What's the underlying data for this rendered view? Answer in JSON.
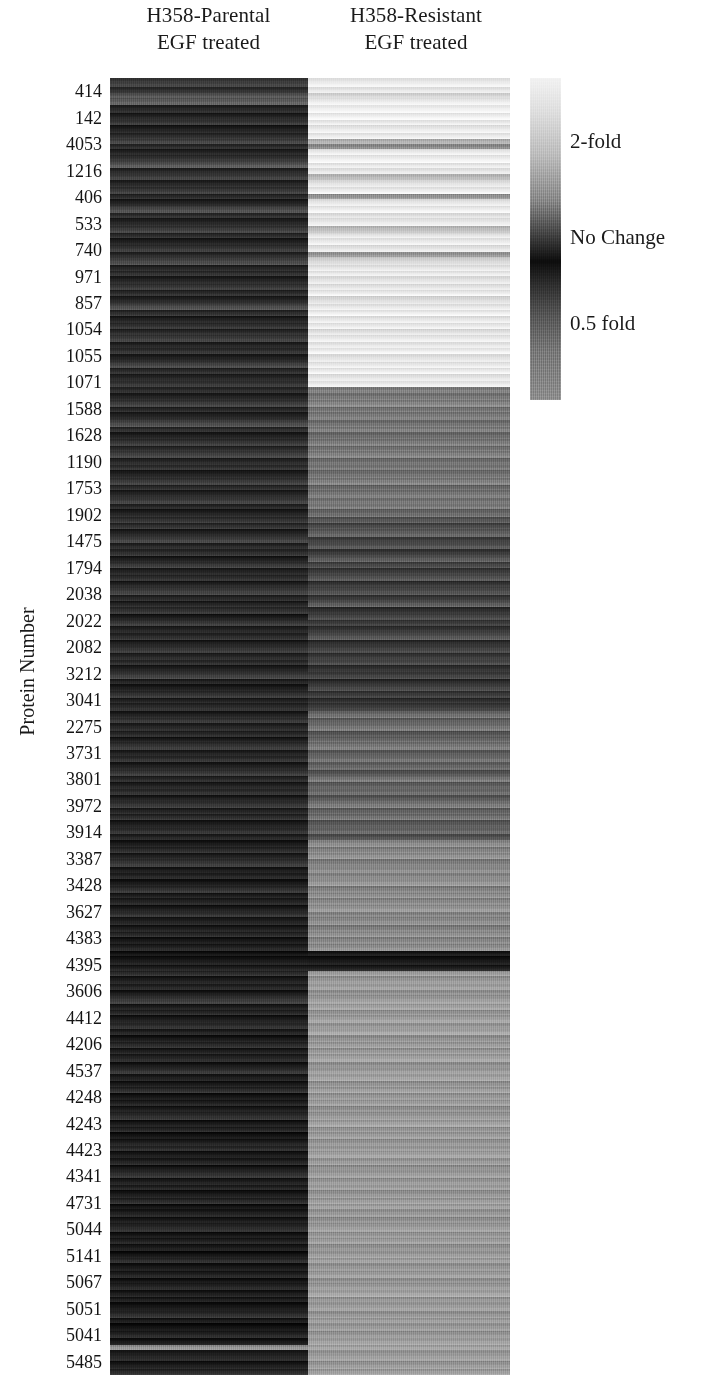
{
  "figure": {
    "type": "heatmap",
    "background": "#ffffff",
    "y_axis_title": "Protein Number"
  },
  "columns": [
    {
      "id": "parental",
      "line1": "H358-Parental",
      "line2": "EGF treated"
    },
    {
      "id": "resistant",
      "line1": "H358-Resistant",
      "line2": "EGF treated"
    }
  ],
  "legend": {
    "title": "",
    "high_label": "2-fold",
    "mid_label": "No Change",
    "low_label": "0.5 fold",
    "high_color": "#f2f2f2",
    "mid_color": "#0d0d0d",
    "low_color": "#8f8f8f"
  },
  "row_labels": [
    "414",
    "142",
    "4053",
    "1216",
    "406",
    "533",
    "740",
    "971",
    "857",
    "1054",
    "1055",
    "1071",
    "1588",
    "1628",
    "1190",
    "1753",
    "1902",
    "1475",
    "1794",
    "2038",
    "2022",
    "2082",
    "3212",
    "3041",
    "2275",
    "3731",
    "3801",
    "3972",
    "3914",
    "3387",
    "3428",
    "3627",
    "4383",
    "4395",
    "3606",
    "4412",
    "4206",
    "4537",
    "4248",
    "4243",
    "4423",
    "4341",
    "4731",
    "5044",
    "5141",
    "5067",
    "5051",
    "5041",
    "5485"
  ],
  "chart_data": {
    "type": "heatmap",
    "title": "",
    "xlabel": "",
    "ylabel": "Protein Number",
    "colormap": "grayscale",
    "colorbar": {
      "ticks": [
        {
          "value": 2.0,
          "label": "2-fold",
          "position": 0.2
        },
        {
          "value": 1.0,
          "label": "No Change",
          "position": 0.5
        },
        {
          "value": 0.5,
          "label": "0.5 fold",
          "position": 0.77
        }
      ],
      "vmin_label": "0.5 fold",
      "vmax_label": "2-fold",
      "orientation": "vertical"
    },
    "categories": [
      "H358-Parental EGF treated",
      "H358-Resistant EGF treated"
    ],
    "y_tick_labels": [
      "414",
      "142",
      "4053",
      "1216",
      "406",
      "533",
      "740",
      "971",
      "857",
      "1054",
      "1055",
      "1071",
      "1588",
      "1628",
      "1190",
      "1753",
      "1902",
      "1475",
      "1794",
      "2038",
      "2022",
      "2082",
      "3212",
      "3041",
      "2275",
      "3731",
      "3801",
      "3972",
      "3914",
      "3387",
      "3428",
      "3627",
      "4383",
      "4395",
      "3606",
      "4412",
      "4206",
      "4537",
      "4248",
      "4243",
      "4423",
      "4341",
      "4731",
      "5044",
      "5141",
      "5067",
      "5051",
      "5041",
      "5485"
    ],
    "note": "Rows are ordered protein bands; values are grayscale intensity 0-255 sampled per band for each of the two columns. Light = up to 2-fold, black = no change, mid-gray = 0.5 fold.",
    "bands": [
      {
        "h": 10,
        "parental": 62,
        "resistant": 236
      },
      {
        "h": 7,
        "parental": 48,
        "resistant": 232
      },
      {
        "h": 5,
        "parental": 86,
        "resistant": 214
      },
      {
        "h": 8,
        "parental": 96,
        "resistant": 238
      },
      {
        "h": 9,
        "parental": 40,
        "resistant": 242
      },
      {
        "h": 7,
        "parental": 34,
        "resistant": 240
      },
      {
        "h": 6,
        "parental": 58,
        "resistant": 236
      },
      {
        "h": 8,
        "parental": 30,
        "resistant": 233
      },
      {
        "h": 7,
        "parental": 46,
        "resistant": 237
      },
      {
        "h": 6,
        "parental": 70,
        "resistant": 180
      },
      {
        "h": 5,
        "parental": 44,
        "resistant": 140
      },
      {
        "h": 7,
        "parental": 36,
        "resistant": 236
      },
      {
        "h": 8,
        "parental": 52,
        "resistant": 238
      },
      {
        "h": 6,
        "parental": 92,
        "resistant": 235
      },
      {
        "h": 7,
        "parental": 40,
        "resistant": 231
      },
      {
        "h": 6,
        "parental": 64,
        "resistant": 186
      },
      {
        "h": 8,
        "parental": 38,
        "resistant": 228
      },
      {
        "h": 7,
        "parental": 56,
        "resistant": 236
      },
      {
        "h": 6,
        "parental": 42,
        "resistant": 150
      },
      {
        "h": 8,
        "parental": 34,
        "resistant": 232
      },
      {
        "h": 7,
        "parental": 74,
        "resistant": 238
      },
      {
        "h": 6,
        "parental": 46,
        "resistant": 225
      },
      {
        "h": 9,
        "parental": 36,
        "resistant": 234
      },
      {
        "h": 7,
        "parental": 60,
        "resistant": 190
      },
      {
        "h": 6,
        "parental": 44,
        "resistant": 232
      },
      {
        "h": 8,
        "parental": 32,
        "resistant": 236
      },
      {
        "h": 7,
        "parental": 54,
        "resistant": 228
      },
      {
        "h": 6,
        "parental": 40,
        "resistant": 152
      },
      {
        "h": 8,
        "parental": 68,
        "resistant": 214
      },
      {
        "h": 7,
        "parental": 38,
        "resistant": 232
      },
      {
        "h": 6,
        "parental": 50,
        "resistant": 236
      },
      {
        "h": 8,
        "parental": 34,
        "resistant": 226
      },
      {
        "h": 7,
        "parental": 58,
        "resistant": 230
      },
      {
        "h": 6,
        "parental": 42,
        "resistant": 236
      },
      {
        "h": 9,
        "parental": 36,
        "resistant": 220
      },
      {
        "h": 7,
        "parental": 78,
        "resistant": 234
      },
      {
        "h": 6,
        "parental": 44,
        "resistant": 238
      },
      {
        "h": 8,
        "parental": 32,
        "resistant": 230
      },
      {
        "h": 7,
        "parental": 52,
        "resistant": 236
      },
      {
        "h": 6,
        "parental": 40,
        "resistant": 224
      },
      {
        "h": 8,
        "parental": 62,
        "resistant": 236
      },
      {
        "h": 7,
        "parental": 36,
        "resistant": 232
      },
      {
        "h": 6,
        "parental": 48,
        "resistant": 238
      },
      {
        "h": 9,
        "parental": 34,
        "resistant": 228
      },
      {
        "h": 7,
        "parental": 70,
        "resistant": 235
      },
      {
        "h": 6,
        "parental": 42,
        "resistant": 236
      },
      {
        "h": 8,
        "parental": 38,
        "resistant": 230
      },
      {
        "h": 7,
        "parental": 56,
        "resistant": 237
      },
      {
        "h": 6,
        "parental": 44,
        "resistant": 128
      },
      {
        "h": 8,
        "parental": 34,
        "resistant": 120
      },
      {
        "h": 7,
        "parental": 60,
        "resistant": 134
      },
      {
        "h": 6,
        "parental": 40,
        "resistant": 118
      },
      {
        "h": 9,
        "parental": 36,
        "resistant": 126
      },
      {
        "h": 7,
        "parental": 72,
        "resistant": 112
      },
      {
        "h": 6,
        "parental": 46,
        "resistant": 130
      },
      {
        "h": 8,
        "parental": 32,
        "resistant": 108
      },
      {
        "h": 7,
        "parental": 54,
        "resistant": 124
      },
      {
        "h": 6,
        "parental": 42,
        "resistant": 116
      },
      {
        "h": 8,
        "parental": 66,
        "resistant": 132
      },
      {
        "h": 7,
        "parental": 38,
        "resistant": 110
      },
      {
        "h": 6,
        "parental": 50,
        "resistant": 122
      },
      {
        "h": 9,
        "parental": 34,
        "resistant": 114
      },
      {
        "h": 7,
        "parental": 58,
        "resistant": 128
      },
      {
        "h": 6,
        "parental": 44,
        "resistant": 106
      },
      {
        "h": 8,
        "parental": 36,
        "resistant": 120
      },
      {
        "h": 7,
        "parental": 64,
        "resistant": 118
      },
      {
        "h": 6,
        "parental": 40,
        "resistant": 126
      },
      {
        "h": 8,
        "parental": 32,
        "resistant": 104
      },
      {
        "h": 7,
        "parental": 52,
        "resistant": 88
      },
      {
        "h": 6,
        "parental": 46,
        "resistant": 72
      },
      {
        "h": 9,
        "parental": 34,
        "resistant": 96
      },
      {
        "h": 7,
        "parental": 68,
        "resistant": 64
      },
      {
        "h": 6,
        "parental": 38,
        "resistant": 84
      },
      {
        "h": 8,
        "parental": 44,
        "resistant": 56
      },
      {
        "h": 7,
        "parental": 30,
        "resistant": 92
      },
      {
        "h": 6,
        "parental": 56,
        "resistant": 70
      },
      {
        "h": 8,
        "parental": 36,
        "resistant": 60
      },
      {
        "h": 7,
        "parental": 48,
        "resistant": 86
      },
      {
        "h": 6,
        "parental": 32,
        "resistant": 52
      },
      {
        "h": 9,
        "parental": 62,
        "resistant": 78
      },
      {
        "h": 7,
        "parental": 40,
        "resistant": 58
      },
      {
        "h": 6,
        "parental": 34,
        "resistant": 90
      },
      {
        "h": 8,
        "parental": 50,
        "resistant": 48
      },
      {
        "h": 7,
        "parental": 28,
        "resistant": 74
      },
      {
        "h": 6,
        "parental": 58,
        "resistant": 62
      },
      {
        "h": 8,
        "parental": 36,
        "resistant": 54
      },
      {
        "h": 7,
        "parental": 42,
        "resistant": 82
      },
      {
        "h": 6,
        "parental": 30,
        "resistant": 46
      },
      {
        "h": 9,
        "parental": 54,
        "resistant": 68
      },
      {
        "h": 7,
        "parental": 38,
        "resistant": 56
      },
      {
        "h": 6,
        "parental": 46,
        "resistant": 76
      },
      {
        "h": 8,
        "parental": 32,
        "resistant": 50
      },
      {
        "h": 7,
        "parental": 60,
        "resistant": 64
      },
      {
        "h": 6,
        "parental": 36,
        "resistant": 44
      },
      {
        "h": 8,
        "parental": 28,
        "resistant": 70
      },
      {
        "h": 7,
        "parental": 50,
        "resistant": 58
      },
      {
        "h": 6,
        "parental": 34,
        "resistant": 48
      },
      {
        "h": 9,
        "parental": 44,
        "resistant": 62
      },
      {
        "h": 7,
        "parental": 30,
        "resistant": 108
      },
      {
        "h": 6,
        "parental": 56,
        "resistant": 96
      },
      {
        "h": 8,
        "parental": 36,
        "resistant": 116
      },
      {
        "h": 7,
        "parental": 42,
        "resistant": 88
      },
      {
        "h": 6,
        "parental": 28,
        "resistant": 104
      },
      {
        "h": 8,
        "parental": 52,
        "resistant": 120
      },
      {
        "h": 7,
        "parental": 34,
        "resistant": 92
      },
      {
        "h": 6,
        "parental": 46,
        "resistant": 112
      },
      {
        "h": 9,
        "parental": 30,
        "resistant": 100
      },
      {
        "h": 7,
        "parental": 58,
        "resistant": 84
      },
      {
        "h": 6,
        "parental": 38,
        "resistant": 118
      },
      {
        "h": 8,
        "parental": 32,
        "resistant": 94
      },
      {
        "h": 7,
        "parental": 48,
        "resistant": 110
      },
      {
        "h": 6,
        "parental": 28,
        "resistant": 86
      },
      {
        "h": 8,
        "parental": 54,
        "resistant": 122
      },
      {
        "h": 7,
        "parental": 36,
        "resistant": 98
      },
      {
        "h": 6,
        "parental": 42,
        "resistant": 114
      },
      {
        "h": 9,
        "parental": 30,
        "resistant": 90
      },
      {
        "h": 7,
        "parental": 50,
        "resistant": 106
      },
      {
        "h": 6,
        "parental": 34,
        "resistant": 80
      },
      {
        "h": 8,
        "parental": 26,
        "resistant": 140
      },
      {
        "h": 7,
        "parental": 44,
        "resistant": 132
      },
      {
        "h": 6,
        "parental": 32,
        "resistant": 148
      },
      {
        "h": 9,
        "parental": 56,
        "resistant": 128
      },
      {
        "h": 7,
        "parental": 28,
        "resistant": 144
      },
      {
        "h": 6,
        "parental": 38,
        "resistant": 136
      },
      {
        "h": 8,
        "parental": 24,
        "resistant": 152
      },
      {
        "h": 7,
        "parental": 48,
        "resistant": 130
      },
      {
        "h": 6,
        "parental": 30,
        "resistant": 146
      },
      {
        "h": 8,
        "parental": 36,
        "resistant": 138
      },
      {
        "h": 7,
        "parental": 26,
        "resistant": 150
      },
      {
        "h": 6,
        "parental": 52,
        "resistant": 134
      },
      {
        "h": 9,
        "parental": 32,
        "resistant": 142
      },
      {
        "h": 7,
        "parental": 28,
        "resistant": 128
      },
      {
        "h": 6,
        "parental": 42,
        "resistant": 148
      },
      {
        "h": 8,
        "parental": 24,
        "resistant": 136
      },
      {
        "h": 7,
        "parental": 34,
        "resistant": 144
      },
      {
        "h": 6,
        "parental": 20,
        "resistant": 26
      },
      {
        "h": 9,
        "parental": 24,
        "resistant": 22
      },
      {
        "h": 7,
        "parental": 30,
        "resistant": 30
      },
      {
        "h": 6,
        "parental": 46,
        "resistant": 158
      },
      {
        "h": 8,
        "parental": 28,
        "resistant": 150
      },
      {
        "h": 7,
        "parental": 38,
        "resistant": 162
      },
      {
        "h": 6,
        "parental": 24,
        "resistant": 146
      },
      {
        "h": 9,
        "parental": 54,
        "resistant": 156
      },
      {
        "h": 7,
        "parental": 30,
        "resistant": 164
      },
      {
        "h": 6,
        "parental": 40,
        "resistant": 148
      },
      {
        "h": 8,
        "parental": 26,
        "resistant": 160
      },
      {
        "h": 7,
        "parental": 48,
        "resistant": 152
      },
      {
        "h": 6,
        "parental": 32,
        "resistant": 166
      },
      {
        "h": 8,
        "parental": 22,
        "resistant": 144
      },
      {
        "h": 7,
        "parental": 44,
        "resistant": 158
      },
      {
        "h": 6,
        "parental": 28,
        "resistant": 150
      },
      {
        "h": 9,
        "parental": 36,
        "resistant": 162
      },
      {
        "h": 7,
        "parental": 24,
        "resistant": 146
      },
      {
        "h": 6,
        "parental": 50,
        "resistant": 156
      },
      {
        "h": 8,
        "parental": 30,
        "resistant": 164
      },
      {
        "h": 7,
        "parental": 26,
        "resistant": 148
      },
      {
        "h": 6,
        "parental": 42,
        "resistant": 158
      },
      {
        "h": 8,
        "parental": 22,
        "resistant": 152
      },
      {
        "h": 7,
        "parental": 34,
        "resistant": 160
      },
      {
        "h": 6,
        "parental": 28,
        "resistant": 146
      },
      {
        "h": 9,
        "parental": 46,
        "resistant": 154
      },
      {
        "h": 7,
        "parental": 24,
        "resistant": 162
      },
      {
        "h": 6,
        "parental": 38,
        "resistant": 150
      },
      {
        "h": 8,
        "parental": 20,
        "resistant": 158
      },
      {
        "h": 7,
        "parental": 30,
        "resistant": 148
      },
      {
        "h": 6,
        "parental": 44,
        "resistant": 156
      },
      {
        "h": 8,
        "parental": 26,
        "resistant": 164
      },
      {
        "h": 7,
        "parental": 32,
        "resistant": 152
      },
      {
        "h": 6,
        "parental": 22,
        "resistant": 146
      },
      {
        "h": 9,
        "parental": 48,
        "resistant": 158
      },
      {
        "h": 7,
        "parental": 28,
        "resistant": 150
      },
      {
        "h": 6,
        "parental": 36,
        "resistant": 160
      },
      {
        "h": 8,
        "parental": 24,
        "resistant": 148
      },
      {
        "h": 7,
        "parental": 40,
        "resistant": 156
      },
      {
        "h": 6,
        "parental": 20,
        "resistant": 162
      },
      {
        "h": 8,
        "parental": 30,
        "resistant": 150
      },
      {
        "h": 7,
        "parental": 26,
        "resistant": 146
      },
      {
        "h": 10,
        "parental": 42,
        "resistant": 158
      },
      {
        "h": 7,
        "parental": 22,
        "resistant": 152
      },
      {
        "h": 6,
        "parental": 34,
        "resistant": 160
      },
      {
        "h": 8,
        "parental": 28,
        "resistant": 148
      },
      {
        "h": 7,
        "parental": 18,
        "resistant": 154
      },
      {
        "h": 6,
        "parental": 46,
        "resistant": 162
      },
      {
        "h": 9,
        "parental": 24,
        "resistant": 150
      },
      {
        "h": 7,
        "parental": 32,
        "resistant": 158
      },
      {
        "h": 6,
        "parental": 20,
        "resistant": 146
      },
      {
        "h": 8,
        "parental": 38,
        "resistant": 156
      },
      {
        "h": 7,
        "parental": 26,
        "resistant": 164
      },
      {
        "h": 6,
        "parental": 30,
        "resistant": 152
      },
      {
        "h": 10,
        "parental": 22,
        "resistant": 158
      },
      {
        "h": 7,
        "parental": 44,
        "resistant": 148
      },
      {
        "h": 6,
        "parental": 28,
        "resistant": 160
      },
      {
        "h": 9,
        "parental": 18,
        "resistant": 154
      },
      {
        "h": 7,
        "parental": 36,
        "resistant": 150
      },
      {
        "h": 8,
        "parental": 24,
        "resistant": 162
      },
      {
        "h": 6,
        "parental": 150,
        "resistant": 166
      },
      {
        "h": 12,
        "parental": 34,
        "resistant": 156
      },
      {
        "h": 8,
        "parental": 26,
        "resistant": 152
      },
      {
        "h": 7,
        "parental": 44,
        "resistant": 160
      }
    ]
  }
}
